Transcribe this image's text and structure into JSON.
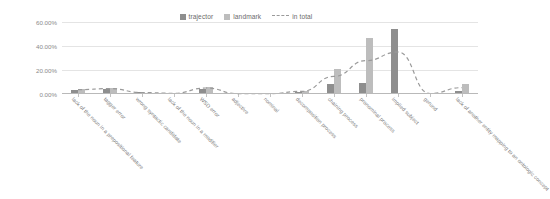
{
  "chart_data": {
    "type": "bar",
    "title": "",
    "xlabel": "",
    "ylabel": "",
    "ylim": [
      0,
      60
    ],
    "grid": true,
    "legend_position": "top-center",
    "ytick_labels": [
      "0.00%",
      "20.00%",
      "40.00%",
      "60.00%"
    ],
    "ytick_values": [
      0,
      20,
      40,
      60
    ],
    "categories": [
      "lack of the noun in a prepositional feature",
      "tagger error",
      "wrong syntactic candidate",
      "lack of the noun in a modifier",
      "WSD error",
      "adjective",
      "nominal",
      "decomposition process",
      "chaining process",
      "pronominal process",
      "implied subject",
      "gerund",
      "lack of another entity mapping to an ontologic concept"
    ],
    "series": [
      {
        "name": "trajector",
        "color": "#8e8e8e",
        "values": [
          3.2,
          4.3,
          1.3,
          0.6,
          4.3,
          0.4,
          0.2,
          1.6,
          8.6,
          9.3,
          54.5,
          0.3,
          2.4
        ]
      },
      {
        "name": "landmark",
        "color": "#bdbdbd",
        "values": [
          4.1,
          4.6,
          1.0,
          0.5,
          5.6,
          0.2,
          0.3,
          2.8,
          20.8,
          46.3,
          0.5,
          0.4,
          8.2
        ]
      },
      {
        "name": "in total",
        "color": "#9a9a9a",
        "style": "dashed-line",
        "values": [
          3.6,
          4.5,
          1.2,
          0.6,
          5.0,
          0.3,
          0.3,
          2.2,
          14.7,
          27.8,
          35.0,
          0.4,
          5.3
        ]
      }
    ]
  },
  "legend": {
    "items": [
      {
        "label": "trajector",
        "type": "swatch",
        "color": "#8e8e8e"
      },
      {
        "label": "landmark",
        "type": "swatch",
        "color": "#bdbdbd"
      },
      {
        "label": "in total",
        "type": "dash",
        "color": "#9a9a9a"
      }
    ]
  }
}
